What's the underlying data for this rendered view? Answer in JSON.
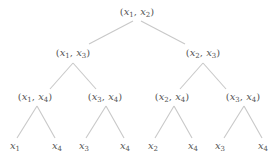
{
  "diagram": {
    "type": "binary-tree",
    "edge_color": "#c8c8c8",
    "text_color": "#555555",
    "nodes": [
      {
        "id": "n0",
        "label": "(x1, x2)",
        "vars": [
          [
            "x",
            "1"
          ],
          [
            "x",
            "2"
          ]
        ],
        "x": 137,
        "y": 13,
        "level": 0
      },
      {
        "id": "n1",
        "label": "(x1, x3)",
        "vars": [
          [
            "x",
            "1"
          ],
          [
            "x",
            "3"
          ]
        ],
        "x": 73,
        "y": 54,
        "level": 1
      },
      {
        "id": "n2",
        "label": "(x2, x3)",
        "vars": [
          [
            "x",
            "2"
          ],
          [
            "x",
            "3"
          ]
        ],
        "x": 203,
        "y": 54,
        "level": 1
      },
      {
        "id": "n3",
        "label": "(x1, x4)",
        "vars": [
          [
            "x",
            "1"
          ],
          [
            "x",
            "4"
          ]
        ],
        "x": 35,
        "y": 98,
        "level": 2
      },
      {
        "id": "n4",
        "label": "(x3, x4)",
        "vars": [
          [
            "x",
            "3"
          ],
          [
            "x",
            "4"
          ]
        ],
        "x": 105,
        "y": 98,
        "level": 2
      },
      {
        "id": "n5",
        "label": "(x2, x4)",
        "vars": [
          [
            "x",
            "2"
          ],
          [
            "x",
            "4"
          ]
        ],
        "x": 172,
        "y": 98,
        "level": 2
      },
      {
        "id": "n6",
        "label": "(x3, x4)",
        "vars": [
          [
            "x",
            "3"
          ],
          [
            "x",
            "4"
          ]
        ],
        "x": 243,
        "y": 98,
        "level": 2
      },
      {
        "id": "l0",
        "label": "x1",
        "vars": [
          [
            "x",
            "1"
          ]
        ],
        "x": 15,
        "y": 147,
        "level": 3
      },
      {
        "id": "l1",
        "label": "x4",
        "vars": [
          [
            "x",
            "4"
          ]
        ],
        "x": 57,
        "y": 147,
        "level": 3
      },
      {
        "id": "l2",
        "label": "x3",
        "vars": [
          [
            "x",
            "3"
          ]
        ],
        "x": 84,
        "y": 147,
        "level": 3
      },
      {
        "id": "l3",
        "label": "x4",
        "vars": [
          [
            "x",
            "4"
          ]
        ],
        "x": 125,
        "y": 147,
        "level": 3
      },
      {
        "id": "l4",
        "label": "x2",
        "vars": [
          [
            "x",
            "2"
          ]
        ],
        "x": 153,
        "y": 147,
        "level": 3
      },
      {
        "id": "l5",
        "label": "x4",
        "vars": [
          [
            "x",
            "4"
          ]
        ],
        "x": 193,
        "y": 147,
        "level": 3
      },
      {
        "id": "l6",
        "label": "x3",
        "vars": [
          [
            "x",
            "3"
          ]
        ],
        "x": 220,
        "y": 147,
        "level": 3
      },
      {
        "id": "l7",
        "label": "x4",
        "vars": [
          [
            "x",
            "4"
          ]
        ],
        "x": 263,
        "y": 147,
        "level": 3
      }
    ],
    "edges": [
      {
        "from": "n0",
        "to": "n1",
        "x1": 133,
        "y1": 21,
        "x2": 89,
        "y2": 44
      },
      {
        "from": "n0",
        "to": "n2",
        "x1": 141,
        "y1": 21,
        "x2": 185,
        "y2": 44
      },
      {
        "from": "n1",
        "to": "n3",
        "x1": 73,
        "y1": 63,
        "x2": 50,
        "y2": 89
      },
      {
        "from": "n1",
        "to": "n4",
        "x1": 73,
        "y1": 63,
        "x2": 96,
        "y2": 89
      },
      {
        "from": "n2",
        "to": "n5",
        "x1": 203,
        "y1": 63,
        "x2": 180,
        "y2": 89
      },
      {
        "from": "n2",
        "to": "n6",
        "x1": 203,
        "y1": 63,
        "x2": 226,
        "y2": 89
      },
      {
        "from": "n3",
        "to": "l0",
        "x1": 37,
        "y1": 106,
        "x2": 17,
        "y2": 138
      },
      {
        "from": "n3",
        "to": "l1",
        "x1": 37,
        "y1": 106,
        "x2": 55,
        "y2": 138
      },
      {
        "from": "n4",
        "to": "l2",
        "x1": 106,
        "y1": 106,
        "x2": 86,
        "y2": 138
      },
      {
        "from": "n4",
        "to": "l3",
        "x1": 106,
        "y1": 106,
        "x2": 124,
        "y2": 138
      },
      {
        "from": "n5",
        "to": "l4",
        "x1": 174,
        "y1": 106,
        "x2": 155,
        "y2": 138
      },
      {
        "from": "n5",
        "to": "l5",
        "x1": 174,
        "y1": 106,
        "x2": 192,
        "y2": 138
      },
      {
        "from": "n6",
        "to": "l6",
        "x1": 244,
        "y1": 106,
        "x2": 224,
        "y2": 138
      },
      {
        "from": "n6",
        "to": "l7",
        "x1": 244,
        "y1": 106,
        "x2": 262,
        "y2": 138
      }
    ]
  }
}
